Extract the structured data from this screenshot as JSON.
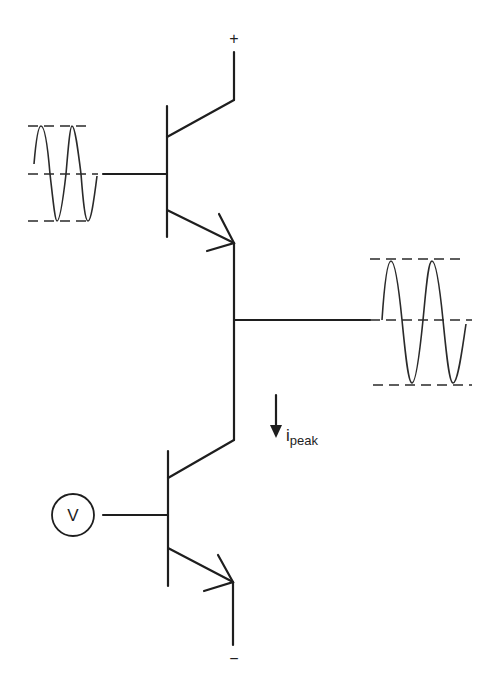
{
  "diagram": {
    "type": "complementary-emitter-follower-push-pull circuit",
    "colors": {
      "ink": "#1e1e1e",
      "background": "#ffffff"
    },
    "supply": {
      "positive_label": "+",
      "negative_label": "−"
    },
    "source": {
      "label": "V"
    },
    "current": {
      "label_main": "i",
      "label_sub": "peak"
    },
    "components": [
      {
        "id": "q-upper",
        "kind": "npn-transistor"
      },
      {
        "id": "q-lower",
        "kind": "npn-transistor"
      },
      {
        "id": "input-waveform",
        "kind": "sine-wave-with-reference-lines",
        "cycles": 2
      },
      {
        "id": "output-waveform",
        "kind": "sine-wave-with-reference-lines",
        "cycles": 2
      },
      {
        "id": "voltage-source",
        "kind": "circle-source"
      }
    ]
  }
}
